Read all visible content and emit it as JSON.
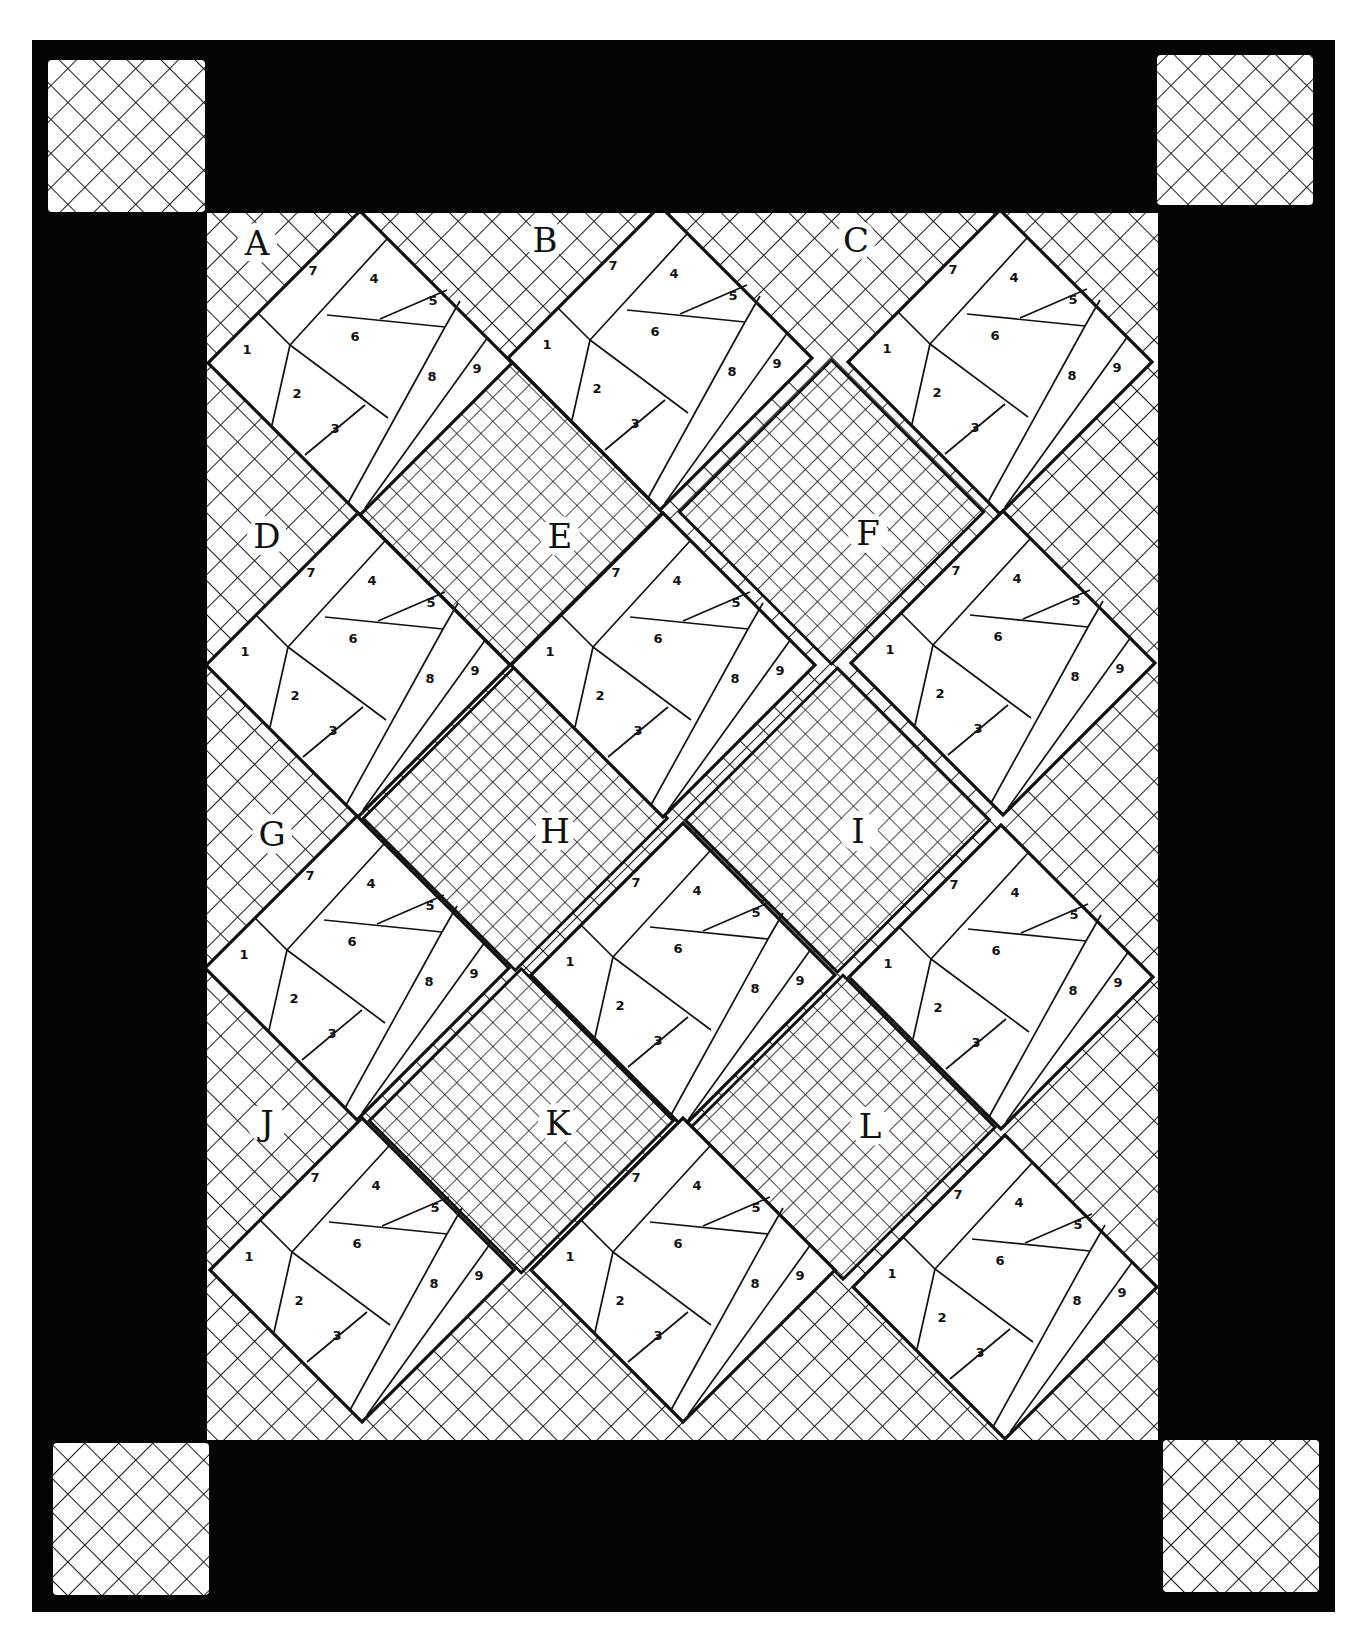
{
  "diagram": {
    "type": "quilt-layout",
    "colors": {
      "border": "#050505",
      "background": "#ffffff",
      "line": "#111111",
      "hatch": "#1a1a1a"
    },
    "outer_border": {
      "x": 32,
      "y": 40,
      "w": 1303,
      "h": 1572
    },
    "inner_field": {
      "x": 207,
      "y": 213,
      "w": 951,
      "h": 1227
    },
    "corner_squares": [
      {
        "id": "top-left",
        "x": 48,
        "y": 60,
        "w": 157,
        "h": 152
      },
      {
        "id": "top-right",
        "x": 1157,
        "y": 55,
        "w": 156,
        "h": 150
      },
      {
        "id": "bottom-left",
        "x": 53,
        "y": 1443,
        "w": 156,
        "h": 152
      },
      {
        "id": "bottom-right",
        "x": 1163,
        "y": 1440,
        "w": 156,
        "h": 152
      }
    ],
    "block_half_diagonal": 152,
    "blocks": [
      {
        "label": "A",
        "cx": 360,
        "cy": 363,
        "lx": 257,
        "ly": 255
      },
      {
        "label": "B",
        "cx": 660,
        "cy": 358,
        "lx": 545,
        "ly": 252
      },
      {
        "label": "C",
        "cx": 1000,
        "cy": 362,
        "lx": 856,
        "ly": 252
      },
      {
        "label": "D",
        "cx": 358,
        "cy": 665,
        "lx": 267,
        "ly": 548
      },
      {
        "label": "E",
        "cx": 663,
        "cy": 665,
        "lx": 560,
        "ly": 548
      },
      {
        "label": "F",
        "cx": 1003,
        "cy": 663,
        "lx": 868,
        "ly": 545
      },
      {
        "label": "G",
        "cx": 357,
        "cy": 968,
        "lx": 272,
        "ly": 846
      },
      {
        "label": "H",
        "cx": 683,
        "cy": 975,
        "lx": 555,
        "ly": 843
      },
      {
        "label": "I",
        "cx": 1001,
        "cy": 977,
        "lx": 858,
        "ly": 843
      },
      {
        "label": "J",
        "cx": 362,
        "cy": 1270,
        "lx": 267,
        "ly": 1135
      },
      {
        "label": "K",
        "cx": 683,
        "cy": 1270,
        "lx": 558,
        "ly": 1135
      },
      {
        "label": "L",
        "cx": 1005,
        "cy": 1287,
        "lx": 870,
        "ly": 1138
      }
    ],
    "piece_numbers": [
      "1",
      "2",
      "3",
      "4",
      "5",
      "6",
      "7",
      "8",
      "9"
    ]
  }
}
